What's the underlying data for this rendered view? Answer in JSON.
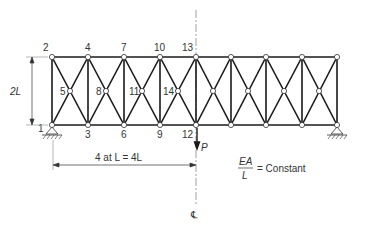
{
  "figure": {
    "type": "truss-diagram",
    "colors": {
      "member": "#1a1a1a",
      "node_fill": "#ffffff",
      "text": "#333333",
      "centerline": "#888888"
    },
    "node_labels": {
      "n1": "1",
      "n2": "2",
      "n3": "3",
      "n4": "4",
      "n5": "5",
      "n6": "6",
      "n7": "7",
      "n8": "8",
      "n9": "9",
      "n10": "10",
      "n11": "11",
      "n12": "12",
      "n13": "13",
      "n14": "14"
    },
    "dimensions": {
      "height_label": "2L",
      "span_label": "4 at L = 4L"
    },
    "load": {
      "label": "P"
    },
    "property": {
      "numerator": "EA",
      "denominator": "L",
      "rest": "= Constant"
    },
    "centerline_symbol": "℄",
    "panels": 8
  }
}
